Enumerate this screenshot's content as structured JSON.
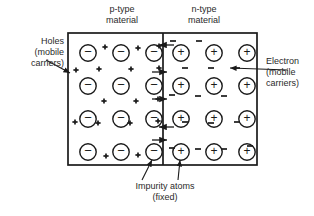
{
  "figure": {
    "title_left": "p-type\nmaterial",
    "title_right": "n-type\nmaterial",
    "label_holes": "Holes\n(mobile\ncarriers)",
    "label_electron": "Electron\n(mobile\ncarriers)",
    "caption_impurity": "Impurity atoms\n(fixed)"
  },
  "diagram_data": {
    "type": "diagram",
    "subject": "pn-junction semiconductor",
    "line_color": "#1a1a1a",
    "background_color": "#ffffff",
    "box": {
      "x": 68,
      "y": 33,
      "width": 189,
      "height": 132
    },
    "junction_x": 163,
    "regions": [
      {
        "name": "p-type",
        "ion_symbol": "−",
        "ion_label": "negative acceptor ion (fixed impurity atom)",
        "carrier_symbol": "+",
        "carrier_label": "hole (mobile carrier)",
        "ion_rows": 4,
        "ion_cols": 3
      },
      {
        "name": "n-type",
        "ion_symbol": "+",
        "ion_label": "positive donor ion (fixed impurity atom)",
        "carrier_symbol": "−",
        "carrier_label": "electron (mobile carrier)",
        "ion_rows": 4,
        "ion_cols": 3
      }
    ],
    "p_ions": [
      [
        88,
        53
      ],
      [
        121,
        53
      ],
      [
        154,
        53
      ],
      [
        88,
        86
      ],
      [
        121,
        86
      ],
      [
        154,
        86
      ],
      [
        88,
        119
      ],
      [
        121,
        119
      ],
      [
        154,
        119
      ],
      [
        88,
        152
      ],
      [
        121,
        152
      ],
      [
        154,
        152
      ]
    ],
    "n_ions": [
      [
        181,
        53
      ],
      [
        214,
        53
      ],
      [
        247,
        53
      ],
      [
        181,
        86
      ],
      [
        214,
        86
      ],
      [
        247,
        86
      ],
      [
        181,
        119
      ],
      [
        214,
        119
      ],
      [
        247,
        119
      ],
      [
        181,
        152
      ],
      [
        214,
        152
      ],
      [
        247,
        152
      ]
    ],
    "holes": [
      [
        105,
        47
      ],
      [
        138,
        48
      ],
      [
        159,
        46
      ],
      [
        76,
        70
      ],
      [
        99,
        69
      ],
      [
        131,
        69
      ],
      [
        159,
        68
      ],
      [
        104,
        101
      ],
      [
        136,
        101
      ],
      [
        158,
        99
      ],
      [
        75,
        122
      ],
      [
        98,
        123
      ],
      [
        130,
        123
      ],
      [
        158,
        121
      ],
      [
        106,
        156
      ],
      [
        138,
        155
      ]
    ],
    "electrons": [
      [
        173,
        41
      ],
      [
        199,
        41
      ],
      [
        185,
        68
      ],
      [
        211,
        68
      ],
      [
        237,
        68
      ],
      [
        172,
        95
      ],
      [
        198,
        96
      ],
      [
        224,
        96
      ],
      [
        185,
        122
      ],
      [
        211,
        123
      ],
      [
        237,
        122
      ],
      [
        172,
        148
      ],
      [
        198,
        149
      ],
      [
        224,
        149
      ],
      [
        250,
        146
      ]
    ],
    "junction_arrows": [
      {
        "y": 45,
        "direction": "left"
      },
      {
        "y": 72,
        "direction": "right"
      },
      {
        "y": 99,
        "direction": "right"
      },
      {
        "y": 127,
        "direction": "left"
      },
      {
        "y": 140,
        "direction": "right"
      }
    ],
    "leaders": [
      {
        "name": "holes-leader",
        "from": [
          46,
          60
        ],
        "to": [
          70,
          73
        ],
        "arrow": true
      },
      {
        "name": "electron-leader",
        "from": [
          288,
          70
        ],
        "to": [
          230,
          68
        ],
        "arrow": true
      },
      {
        "name": "impurity-leader-p",
        "from": [
          142,
          180
        ],
        "to": [
          152,
          160
        ],
        "arrow": true
      },
      {
        "name": "impurity-leader-n",
        "from": [
          178,
          180
        ],
        "to": [
          180,
          160
        ],
        "arrow": true
      }
    ]
  }
}
